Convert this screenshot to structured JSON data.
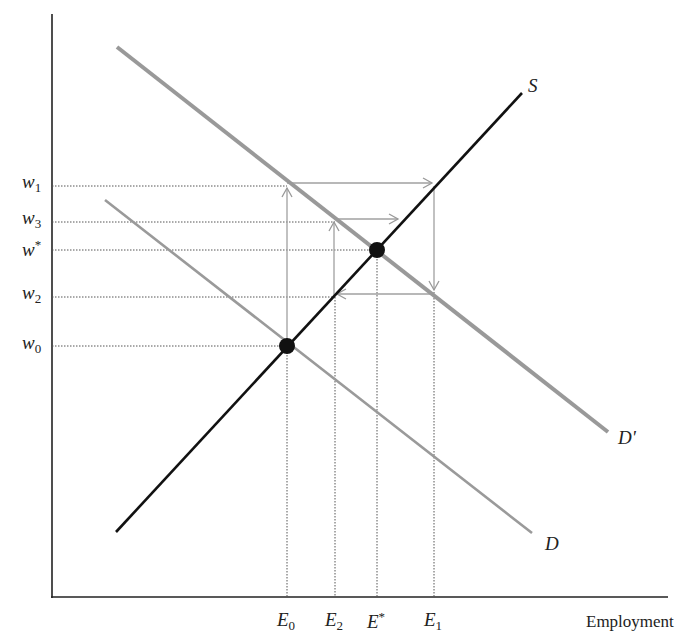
{
  "diagram": {
    "title": "",
    "x_axis_label": "Employment",
    "y_axis_label": "",
    "curves": [
      {
        "id": "S",
        "label": "S",
        "color": "#111111",
        "from": [
          116,
          532
        ],
        "to": [
          522,
          93
        ]
      },
      {
        "id": "D_prime",
        "label": "D'",
        "color": "#999999",
        "from": [
          117,
          47
        ],
        "to": [
          608,
          432
        ]
      },
      {
        "id": "D",
        "label": "D",
        "color": "#9a9a9a",
        "from": [
          105,
          200
        ],
        "to": [
          532,
          533
        ]
      }
    ],
    "y_ticks": [
      {
        "sym": "w",
        "sub": "1",
        "sup": "",
        "y": 186
      },
      {
        "sym": "w",
        "sub": "3",
        "sup": "",
        "y": 222
      },
      {
        "sym": "w",
        "sub": "",
        "sup": "*",
        "y": 250
      },
      {
        "sym": "w",
        "sub": "2",
        "sup": "",
        "y": 297
      },
      {
        "sym": "w",
        "sub": "0",
        "sup": "",
        "y": 346
      }
    ],
    "x_ticks": [
      {
        "sym": "E",
        "sub": "0",
        "sup": "",
        "x": 287
      },
      {
        "sym": "E",
        "sub": "2",
        "sup": "",
        "x": 335
      },
      {
        "sym": "E",
        "sub": "",
        "sup": "*",
        "x": 377
      },
      {
        "sym": "E",
        "sub": "1",
        "sup": "",
        "x": 434
      }
    ],
    "equilibria": [
      {
        "name": "initial",
        "point": [
          "E0",
          "w0"
        ]
      },
      {
        "name": "final",
        "point": [
          "E*",
          "w*"
        ]
      }
    ],
    "cobweb_path": [
      "(E0,w0)",
      "(E0,w1)",
      "(E1,w1)",
      "(E1,w2)",
      "(E2,w2)",
      "(E2,w3)",
      "(E*,w3)"
    ]
  },
  "labels": {
    "S": "S",
    "D_prime": "D'",
    "D": "D",
    "w1": {
      "sym": "w",
      "sub": "1"
    },
    "w3": {
      "sym": "w",
      "sub": "3"
    },
    "wstar": {
      "sym": "w",
      "sup": "*"
    },
    "w2": {
      "sym": "w",
      "sub": "2"
    },
    "w0": {
      "sym": "w",
      "sub": "0"
    },
    "E0": {
      "sym": "E",
      "sub": "0"
    },
    "E2": {
      "sym": "E",
      "sub": "2"
    },
    "Estar": {
      "sym": "E",
      "sup": "*"
    },
    "E1": {
      "sym": "E",
      "sub": "1"
    },
    "x_axis": "Employment"
  }
}
